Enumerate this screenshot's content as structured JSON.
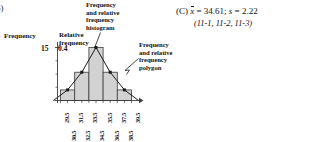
{
  "problem": {
    "list_marker": "b)"
  },
  "figure": {
    "axes": {
      "left_title": "Frequency",
      "left_title_icon": "frequency-axis-label",
      "left_max_label": "15",
      "right_title_line1": "Relative",
      "right_title_line2": "frequency",
      "right_max_label": "0.4"
    },
    "callouts": {
      "histogram": {
        "line1": "Frequency",
        "line2": "and relative",
        "line3": "frequency",
        "line4": "histogram"
      },
      "polygon": {
        "line1": "Frequency",
        "line2": "and relative",
        "line3": "frequency",
        "line4": "polygon"
      }
    },
    "x_tick_labels": [
      "29.5",
      "30.5",
      "31.5",
      "32.5",
      "33.5",
      "34.5",
      "35.5",
      "36.5",
      "37.5",
      "38.5",
      "39.5"
    ]
  },
  "answer": {
    "choice": "(C)",
    "mean_symbol": "x",
    "mean_text": " = 34.61; ",
    "sd_symbol": "s",
    "sd_text": " = 2.22",
    "references": "(11-1, 11-2, 11-3)"
  },
  "colors": {
    "bar_fill": "#d2d2d2",
    "bar_stroke": "#3c3c3c",
    "axis": "#3c3c3c",
    "polygon_line": "#1a1a1a",
    "marker": "#1a1a1a",
    "text": "#111111"
  },
  "chart_data": {
    "type": "bar",
    "xlabel": "",
    "ylabel": "Frequency",
    "y2label": "Relative frequency",
    "ylim": [
      0,
      15
    ],
    "y2lim": [
      0,
      0.4
    ],
    "grid": false,
    "legend": false,
    "bin_edges": [
      29.5,
      31.5,
      33.5,
      35.5,
      37.5,
      39.5
    ],
    "categories": [
      "29.5-31.5",
      "31.5-33.5",
      "33.5-35.5",
      "35.5-37.5",
      "37.5-39.5"
    ],
    "bin_midpoints": [
      30.5,
      32.5,
      34.5,
      36.5,
      38.5
    ],
    "values": [
      3,
      8,
      15,
      8,
      3
    ],
    "relative_values": [
      0.08,
      0.21,
      0.4,
      0.21,
      0.08
    ],
    "series": [
      {
        "name": "Frequency and relative frequency histogram",
        "type": "bar",
        "values": [
          3,
          8,
          15,
          8,
          3
        ]
      },
      {
        "name": "Frequency and relative frequency polygon",
        "type": "line",
        "x": [
          28.5,
          30.5,
          32.5,
          34.5,
          36.5,
          38.5,
          40.5
        ],
        "values": [
          0,
          3,
          8,
          15,
          8,
          3,
          0
        ]
      }
    ]
  }
}
